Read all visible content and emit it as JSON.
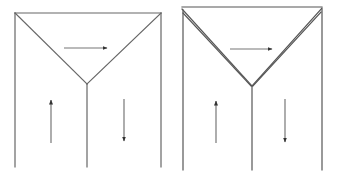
{
  "diagrams": [
    {
      "name": "single-line-junction",
      "stroke": "#666666",
      "lines": [
        {
          "id": "top-edge",
          "x1": 15,
          "y1": 13,
          "x2": 161,
          "y2": 13
        },
        {
          "id": "left-wall",
          "x1": 15,
          "y1": 13,
          "x2": 15,
          "y2": 167
        },
        {
          "id": "right-wall",
          "x1": 161,
          "y1": 13,
          "x2": 161,
          "y2": 167
        },
        {
          "id": "left-diagonal",
          "x1": 15,
          "y1": 13,
          "x2": 87,
          "y2": 84
        },
        {
          "id": "right-diagonal",
          "x1": 161,
          "y1": 13,
          "x2": 87,
          "y2": 84
        },
        {
          "id": "center-stem",
          "x1": 87,
          "y1": 84,
          "x2": 87,
          "y2": 167
        }
      ],
      "arrows": [
        {
          "id": "arrow-right",
          "direction": "right",
          "x1": 64,
          "y1": 48,
          "x2": 107,
          "y2": 48
        },
        {
          "id": "arrow-up",
          "direction": "up",
          "x1": 51,
          "y1": 143,
          "x2": 51,
          "y2": 100
        },
        {
          "id": "arrow-down",
          "direction": "down",
          "x1": 124,
          "y1": 99,
          "x2": 124,
          "y2": 141
        }
      ]
    },
    {
      "name": "double-line-junction",
      "stroke": "#555555",
      "lines": [
        {
          "id": "top-edge",
          "x1": 182,
          "y1": 7,
          "x2": 322,
          "y2": 7
        },
        {
          "id": "left-wall",
          "x1": 183,
          "y1": 10,
          "x2": 183,
          "y2": 170
        },
        {
          "id": "right-wall",
          "x1": 322,
          "y1": 9,
          "x2": 322,
          "y2": 170
        },
        {
          "id": "left-diagonal-outer",
          "x1": 182,
          "y1": 9,
          "x2": 252,
          "y2": 86
        },
        {
          "id": "left-diagonal-inner",
          "x1": 183,
          "y1": 13,
          "x2": 251,
          "y2": 86
        },
        {
          "id": "right-diagonal-outer",
          "x1": 322,
          "y1": 8,
          "x2": 252,
          "y2": 86
        },
        {
          "id": "right-diagonal-inner",
          "x1": 321,
          "y1": 12,
          "x2": 253,
          "y2": 86
        },
        {
          "id": "center-stem",
          "x1": 252,
          "y1": 86,
          "x2": 252,
          "y2": 170
        }
      ],
      "arrows": [
        {
          "id": "arrow-right",
          "direction": "right",
          "x1": 230,
          "y1": 49,
          "x2": 272,
          "y2": 49
        },
        {
          "id": "arrow-up",
          "direction": "up",
          "x1": 216,
          "y1": 143,
          "x2": 216,
          "y2": 101
        },
        {
          "id": "arrow-down",
          "direction": "down",
          "x1": 285,
          "y1": 99,
          "x2": 285,
          "y2": 142
        }
      ]
    }
  ],
  "colors": {
    "background": "#ffffff",
    "arrow": "#444444"
  }
}
